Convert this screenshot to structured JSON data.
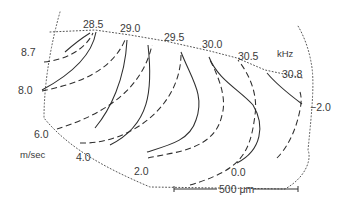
{
  "figure": {
    "frequency_unit": "kHz",
    "velocity_unit": "m/sec",
    "frequency_contours": [
      {
        "label": "28.5",
        "style": "solid"
      },
      {
        "label": "29.0",
        "style": "solid"
      },
      {
        "label": "29.5",
        "style": "solid"
      },
      {
        "label": "30.0",
        "style": "solid"
      },
      {
        "label": "30.5",
        "style": "solid"
      },
      {
        "label": "30.8",
        "style": "solid"
      }
    ],
    "velocity_contours": [
      {
        "label": "8.7",
        "style": "dashed"
      },
      {
        "label": "8.0",
        "style": "dashed"
      },
      {
        "label": "6.0",
        "style": "dashed"
      },
      {
        "label": "4.0",
        "style": "dashed"
      },
      {
        "label": "2.0",
        "style": "dashed"
      },
      {
        "label": "0.0",
        "style": "dashed"
      },
      {
        "label": "−2.0",
        "style": "dashed"
      }
    ],
    "scale_bar": {
      "label": "500 μm"
    },
    "colors": {
      "line": "#2e2e2e",
      "text": "#3a3a3a",
      "background": "#ffffff"
    }
  }
}
